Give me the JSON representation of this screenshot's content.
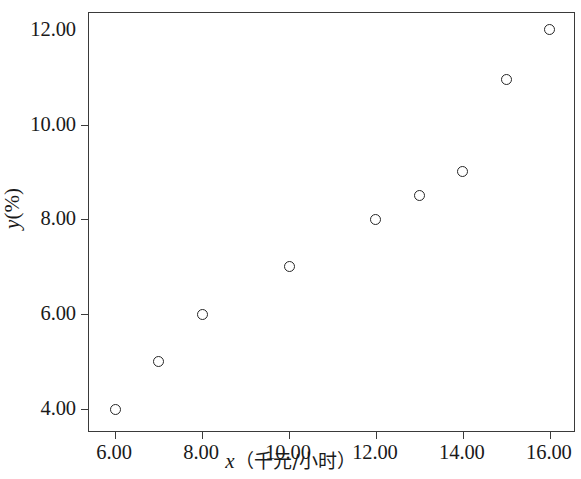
{
  "chart_data": {
    "type": "scatter",
    "title": "",
    "xlabel": "x（千元/小时）",
    "ylabel": "y (%)",
    "xlabel_var": "x",
    "xlabel_unit": "（千元/小时）",
    "ylabel_var": "y",
    "ylabel_unit": "(%)",
    "xlim": [
      5.4,
      16.6
    ],
    "ylim": [
      3.5,
      12.35
    ],
    "grid": false,
    "legend": false,
    "marker": "open-circle",
    "marker_color": "#262626",
    "frame_color": "#3a3a3a",
    "background": "#ffffff",
    "xticks": [
      6,
      8,
      10,
      12,
      14,
      16
    ],
    "xtick_labels": [
      "6.00",
      "8.00",
      "10.00",
      "12.00",
      "14.00",
      "16.00"
    ],
    "yticks": [
      4,
      6,
      8,
      10,
      12
    ],
    "ytick_labels": [
      "4.00",
      "6.00",
      "8.00",
      "10.00",
      "12.00"
    ],
    "ytick_marks": [
      4,
      6,
      8,
      10
    ],
    "x": [
      6,
      7,
      8,
      10,
      12,
      13,
      14,
      15,
      16
    ],
    "y": [
      4.0,
      5.0,
      6.0,
      7.0,
      8.0,
      8.5,
      9.0,
      10.95,
      12.0
    ],
    "points": [
      {
        "x": 6,
        "y": 4.0
      },
      {
        "x": 7,
        "y": 5.0
      },
      {
        "x": 8,
        "y": 6.0
      },
      {
        "x": 10,
        "y": 7.0
      },
      {
        "x": 12,
        "y": 8.0
      },
      {
        "x": 13,
        "y": 8.5
      },
      {
        "x": 14,
        "y": 9.0
      },
      {
        "x": 15,
        "y": 10.95
      },
      {
        "x": 16,
        "y": 12.0
      }
    ]
  }
}
